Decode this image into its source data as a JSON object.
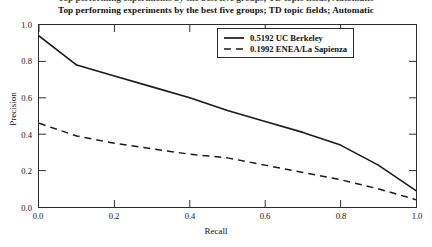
{
  "figure": {
    "title": "Top performing experiments by the best five groups; TD topic fields; Automatic",
    "clipped_top_title": "Top performing experiments by the best five groups; TD topic fields; Automatic"
  },
  "chart_data": {
    "type": "line",
    "title": "Top performing experiments by the best five groups; TD topic fields; Automatic",
    "xlabel": "Recall",
    "ylabel": "Precision",
    "xlim": [
      0.0,
      1.0
    ],
    "ylim": [
      0.0,
      1.0
    ],
    "grid": false,
    "legend_position": "upper right",
    "xticks": [
      "0.0",
      "0.2",
      "0.4",
      "0.6",
      "0.8",
      "1.0"
    ],
    "yticks": [
      "0.0",
      "0.2",
      "0.4",
      "0.6",
      "0.8",
      "1.0"
    ],
    "xtick_values": [
      0.0,
      0.2,
      0.4,
      0.6,
      0.8,
      1.0
    ],
    "ytick_values": [
      0.0,
      0.2,
      0.4,
      0.6,
      0.8,
      1.0
    ],
    "x": [
      0.0,
      0.1,
      0.2,
      0.3,
      0.4,
      0.5,
      0.6,
      0.7,
      0.8,
      0.9,
      1.0
    ],
    "series": [
      {
        "name": "0.5192 UC Berkeley",
        "style": "solid",
        "color": "#1a1a1a",
        "values": [
          0.94,
          0.78,
          0.72,
          0.66,
          0.6,
          0.53,
          0.47,
          0.41,
          0.34,
          0.23,
          0.09
        ]
      },
      {
        "name": "0.1992 ENEA/La Sapienza",
        "style": "dashed",
        "color": "#1a1a1a",
        "values": [
          0.46,
          0.39,
          0.35,
          0.32,
          0.29,
          0.27,
          0.23,
          0.19,
          0.15,
          0.1,
          0.04
        ]
      }
    ]
  },
  "legend": {
    "entries": [
      {
        "label": "0.5192 UC Berkeley",
        "style": "solid"
      },
      {
        "label": "0.1992 ENEA/La Sapienza",
        "style": "dashed"
      }
    ]
  }
}
